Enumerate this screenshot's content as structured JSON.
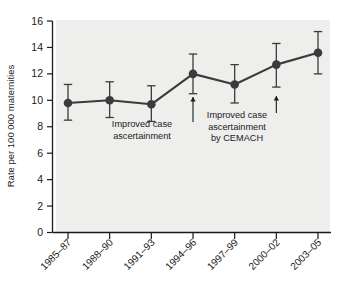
{
  "figure": {
    "name": "maternal-mortality-rate-trend-chart",
    "background_color": "#ffffff",
    "plot_background_color": "#eeeeec",
    "series_color": "#3b3b3b",
    "axis_color": "#1a1a1a"
  },
  "chart_data": {
    "type": "line",
    "title": "",
    "xlabel": "",
    "ylabel": "Rate per 100 000 maternities",
    "categories": [
      "1985–87",
      "1988–90",
      "1991–93",
      "1994–96",
      "1997–99",
      "2000–02",
      "2003–05"
    ],
    "values": [
      9.8,
      10.0,
      9.7,
      12.0,
      11.2,
      12.7,
      13.6
    ],
    "error_low": [
      8.5,
      8.7,
      8.4,
      10.5,
      9.8,
      11.0,
      12.0
    ],
    "error_high": [
      11.2,
      11.4,
      11.1,
      13.5,
      12.7,
      14.3,
      15.2
    ],
    "ylim": [
      0,
      16
    ],
    "yticks": [
      0,
      2,
      4,
      6,
      8,
      10,
      12,
      14,
      16
    ],
    "ytick_labels": [
      "0",
      "2",
      "4",
      "6",
      "8",
      "10",
      "12",
      "14",
      "16"
    ],
    "grid": false,
    "legend": null,
    "marker": "circle",
    "error_bars": "95% confidence interval",
    "annotations": [
      {
        "id": "annotation-improved-case-ascertainment",
        "lines": [
          "Improved case",
          "ascertainment"
        ],
        "points_to_category": "1994–96",
        "arrow": "up"
      },
      {
        "id": "annotation-improved-case-ascertainment-cemach",
        "lines": [
          "Improved case",
          "ascertainment",
          "by CEMACH"
        ],
        "points_to_category": "2000–02",
        "arrow": "up"
      }
    ]
  },
  "axes": {
    "y_axis_title": "Rate per 100 000 maternities"
  }
}
